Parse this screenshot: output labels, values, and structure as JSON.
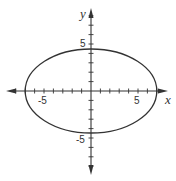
{
  "chart_data": {
    "type": "line",
    "title": "",
    "xlabel": "x",
    "ylabel": "y",
    "shape": "ellipse",
    "center": [
      0,
      0
    ],
    "semi_major_axis_x": 7,
    "semi_minor_axis_y": 4.47,
    "equation": "x^2/49 + y^2/20 = 1",
    "xlim": [
      -9,
      8
    ],
    "ylim": [
      -9,
      9
    ],
    "x_tick_labels": [
      {
        "value": -5,
        "label": "-5"
      },
      {
        "value": 5,
        "label": "5"
      }
    ],
    "y_tick_labels": [
      {
        "value": 5,
        "label": "5"
      },
      {
        "value": -5,
        "label": "-5"
      }
    ],
    "tick_step": 1,
    "grid": false,
    "legend": null
  },
  "style": {
    "axis_color": "#333333",
    "curve_color": "#333333",
    "background": "#ffffff"
  },
  "plot": {
    "origin_px": [
      91,
      91
    ],
    "unit_px": 9.4
  }
}
